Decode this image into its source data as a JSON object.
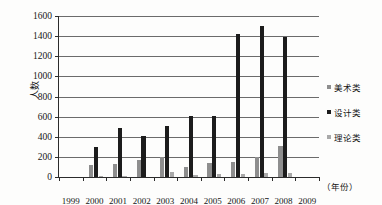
{
  "chart_data": {
    "type": "bar",
    "title": "",
    "xlabel": "（年份）",
    "ylabel": "人数",
    "ylim": [
      0,
      1600
    ],
    "ytick_step": 200,
    "yticks": [
      0,
      200,
      400,
      600,
      800,
      1000,
      1200,
      1400,
      1600
    ],
    "grid": true,
    "legend_position": "right",
    "categories": [
      "1999",
      "2000",
      "2001",
      "2002",
      "2003",
      "2004",
      "2005",
      "2006",
      "2007",
      "2008",
      "2009"
    ],
    "series": [
      {
        "name": "美术类",
        "color": "#8e8e8e",
        "values": [
          0,
          120,
          125,
          170,
          200,
          95,
          140,
          145,
          195,
          310,
          0
        ]
      },
      {
        "name": "设计类",
        "color": "#1c1c1c",
        "values": [
          0,
          300,
          490,
          410,
          505,
          605,
          605,
          1425,
          1505,
          1390,
          0
        ]
      },
      {
        "name": "理论类",
        "color": "#a9a9a9",
        "values": [
          0,
          5,
          15,
          0,
          45,
          20,
          25,
          25,
          40,
          35,
          0
        ]
      }
    ]
  },
  "legend": {
    "items": [
      {
        "label": "美术类",
        "swatch": "series-0-swatch"
      },
      {
        "label": "设计类",
        "swatch": "series-1-swatch"
      },
      {
        "label": "理论类",
        "swatch": "series-2-swatch"
      }
    ]
  },
  "axis": {
    "y_title": "人数",
    "x_unit": "（年份）",
    "y_tick_labels": [
      "1600",
      "1400",
      "1200",
      "1000",
      "800",
      "600",
      "400",
      "200",
      "0"
    ],
    "x_tick_labels": [
      "1999",
      "2000",
      "2001",
      "2002",
      "2003",
      "2004",
      "2005",
      "2006",
      "2007",
      "2008",
      "2009"
    ]
  }
}
